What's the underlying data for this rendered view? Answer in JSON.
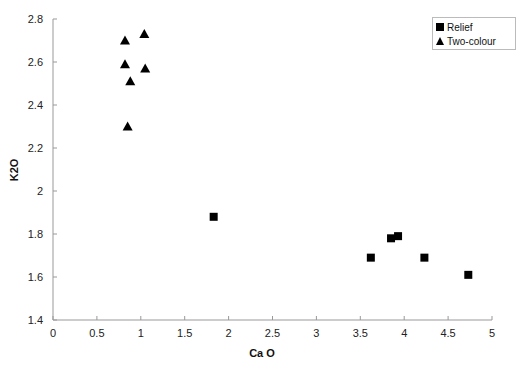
{
  "chart_data": {
    "type": "scatter",
    "title": "",
    "xlabel": "Ca O",
    "ylabel": "K2O",
    "xlim": [
      0,
      5
    ],
    "ylim": [
      1.4,
      2.8
    ],
    "xticks": [
      0,
      0.5,
      1,
      1.5,
      2,
      2.5,
      3,
      3.5,
      4,
      4.5,
      5
    ],
    "yticks": [
      1.4,
      1.6,
      1.8,
      2,
      2.2,
      2.4,
      2.6,
      2.8
    ],
    "grid": false,
    "legend_position": "top-right",
    "series": [
      {
        "name": "Relief",
        "marker": "square",
        "color": "#000000",
        "points": [
          {
            "x": 1.83,
            "y": 1.88
          },
          {
            "x": 3.62,
            "y": 1.69
          },
          {
            "x": 3.85,
            "y": 1.78
          },
          {
            "x": 3.93,
            "y": 1.79
          },
          {
            "x": 4.23,
            "y": 1.69
          },
          {
            "x": 4.73,
            "y": 1.61
          }
        ]
      },
      {
        "name": "Two-colour",
        "marker": "triangle",
        "color": "#000000",
        "points": [
          {
            "x": 0.82,
            "y": 2.7
          },
          {
            "x": 1.04,
            "y": 2.73
          },
          {
            "x": 0.82,
            "y": 2.59
          },
          {
            "x": 1.05,
            "y": 2.57
          },
          {
            "x": 0.88,
            "y": 2.51
          },
          {
            "x": 0.85,
            "y": 2.3
          }
        ]
      }
    ]
  },
  "legend": {
    "items": [
      {
        "label": "Relief",
        "icon": "square-marker-icon"
      },
      {
        "label": "Two-colour",
        "icon": "triangle-marker-icon"
      }
    ]
  }
}
